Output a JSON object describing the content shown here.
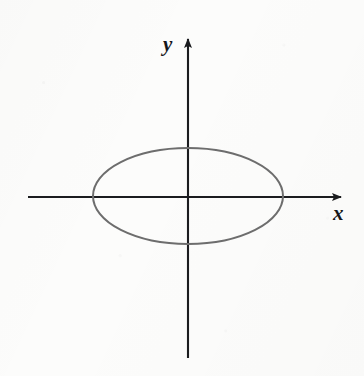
{
  "figure": {
    "kind": "coordinate-plane-with-ellipse",
    "caption": "",
    "background_color": "#fcfcfb",
    "axis_color": "#1b1c1f",
    "curve_color": "#6d6d6d"
  },
  "axes": {
    "x": {
      "label": "x",
      "label_position": {
        "x": 333,
        "y": 203
      },
      "line": {
        "x1": 28,
        "y1": 197,
        "x2": 343,
        "y2": 197
      },
      "arrow": "right",
      "stroke_width": 2
    },
    "y": {
      "label": "y",
      "label_position": {
        "x": 163,
        "y": 34
      },
      "line": {
        "x1": 188,
        "y1": 358,
        "x2": 188,
        "y2": 37
      },
      "arrow": "up",
      "stroke_width": 2
    },
    "origin": {
      "x": 188,
      "y": 197
    }
  },
  "chart_data": {
    "type": "line",
    "title": "",
    "xlabel": "x",
    "ylabel": "y",
    "grid": false,
    "legend": null,
    "annotations": [],
    "xlim": [
      -1.68,
      1.63
    ],
    "ylim": [
      -1.68,
      1.68
    ],
    "curves": [
      {
        "name": "ellipse",
        "shape": "ellipse",
        "center": {
          "x": 0,
          "y": 0
        },
        "semi_axis_x": 1.0,
        "semi_axis_y": 0.5,
        "equation": "x^2 + (y^2)/0.25 = 1",
        "closed": true,
        "color": "#6d6d6d",
        "stroke_width": 2,
        "pixel_center": {
          "x": 188,
          "y": 196
        },
        "pixel_rx": 95,
        "pixel_ry": 48,
        "x_intercepts": [
          -1.0,
          1.0
        ],
        "y_intercepts": [
          -0.5,
          0.5
        ]
      }
    ]
  }
}
